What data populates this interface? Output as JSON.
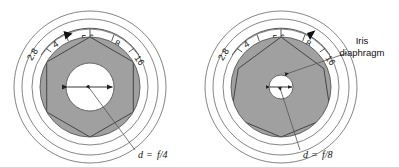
{
  "figure": {
    "background_color": "#ffffff",
    "blade_fill": "#a0a0a0",
    "line_color": "#333333",
    "aperture_hole_fill": "#ffffff"
  },
  "scale": {
    "stops": [
      "2.8",
      "4",
      "5.6",
      "8",
      "16"
    ],
    "tick_count": 5
  },
  "diagrams": [
    {
      "id": "left",
      "name": "wide-aperture-f4",
      "indicator_stop": "4",
      "aperture_label": "d = f/4",
      "aperture_label_parts": {
        "d": "d",
        "eq": "=",
        "value": "f/4"
      },
      "hole_radius_px": 24,
      "stops": [
        "2.8",
        "4",
        "5.6",
        "8",
        "16"
      ]
    },
    {
      "id": "right",
      "name": "narrow-aperture-f8",
      "indicator_stop": "8",
      "aperture_label": "d = f/8",
      "aperture_label_parts": {
        "d": "d",
        "eq": "=",
        "value": "f/8"
      },
      "hole_radius_px": 12,
      "stops": [
        "2.8",
        "4",
        "5.6",
        "8",
        "16"
      ]
    }
  ],
  "annotations": {
    "iris_diaphragm": {
      "line1": "Iris",
      "line2": "diaphragm"
    }
  }
}
